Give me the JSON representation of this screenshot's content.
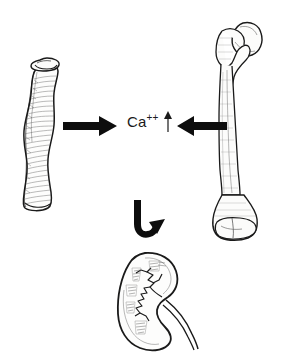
{
  "figure": {
    "background_color": "#ffffff",
    "ink_color": "#1a1a1a",
    "width": 282,
    "height": 359
  },
  "labels": {
    "calcium_ion": "Ca",
    "calcium_charge": "++",
    "calcium_trend": "↑"
  },
  "elements": {
    "soft_bone": {
      "name": "soft-deformed-bone",
      "description": "curved demineralized long bone"
    },
    "normal_bone": {
      "name": "normal-femur",
      "description": "normal femur with head, neck, shaft and condyles"
    },
    "kidney": {
      "name": "kidney",
      "description": "kidney with renal pelvis, calyces and ureter"
    },
    "arrow_right": {
      "name": "arrow-bone-to-blood",
      "direction": "right"
    },
    "arrow_left": {
      "name": "arrow-blood-to-bone",
      "direction": "left"
    },
    "arrow_up_small": {
      "name": "arrow-increase",
      "direction": "up"
    },
    "arrow_curved": {
      "name": "arrow-to-kidney",
      "direction": "u-turn-up-right"
    }
  }
}
